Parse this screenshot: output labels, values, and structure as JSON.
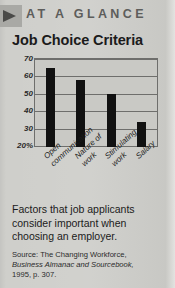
{
  "header": {
    "kicker": "AT A GLANCE",
    "arrow_icon": "triangle-right-icon"
  },
  "chart_data": {
    "type": "bar",
    "title": "Job Choice Criteria",
    "categories": [
      "Open communication",
      "Nature of work",
      "Stimulating work",
      "Salary"
    ],
    "category_lines": [
      [
        "Open",
        "communication"
      ],
      [
        "Nature of",
        "work"
      ],
      [
        "Stimulating",
        "work"
      ],
      [
        "Salary"
      ]
    ],
    "values": [
      65,
      58,
      50,
      34
    ],
    "xlabel": "",
    "ylabel": "",
    "ylim": [
      20,
      70
    ],
    "yticks": [
      70,
      60,
      50,
      40,
      30,
      20
    ],
    "ytick_labels": [
      "70",
      "60",
      "50",
      "40",
      "30",
      "20%"
    ],
    "grid": true,
    "legend": false,
    "bar_color": "#111111",
    "plot_background": "#c9c9c5",
    "axis_color": "#6e6e6c"
  },
  "caption": {
    "text": "Factors that job applicants consider important when choosing an employer."
  },
  "source": {
    "line1": "Source: The Changing Workforce,",
    "line2": "Business Almanac and Sourcebook,",
    "line3": "1995, p. 307."
  }
}
